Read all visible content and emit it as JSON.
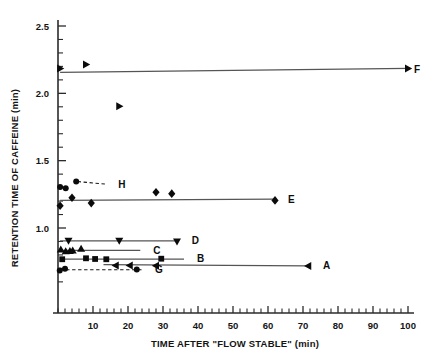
{
  "chart_data": {
    "type": "scatter",
    "title": "",
    "xlabel": "TIME AFTER \"FLOW STABLE\" (min)",
    "ylabel": "RETENTION TIME OF CAFFEINE (min)",
    "xlim": [
      0,
      102
    ],
    "ylim": [
      0.58,
      2.5
    ],
    "grid": false,
    "legend_position": "inline-right-of-series",
    "x_ticks_major": [
      10,
      20,
      30,
      40,
      50,
      60,
      70,
      80,
      90,
      100
    ],
    "x_ticklabels": [
      "10",
      "20",
      "30",
      "40",
      "50",
      "60",
      "70",
      "80",
      "90",
      "100"
    ],
    "x_tick_minor_step": 2,
    "y_ticks_major": [
      1.0,
      1.5,
      2.0,
      2.5
    ],
    "y_ticklabels": [
      "1.0",
      "1.5",
      "2.0",
      "2.5"
    ],
    "y_tick_minor_step": 0.1,
    "series": [
      {
        "name": "F",
        "label": "F",
        "marker": "triangle-right",
        "line": "solid",
        "label_x": 100,
        "label_y": 2.18,
        "trend": [
          [
            0.6,
            2.155
          ],
          [
            100,
            2.185
          ]
        ],
        "points": [
          [
            0.6,
            2.185
          ],
          [
            8.0,
            2.215
          ],
          [
            17.5,
            1.905
          ],
          [
            100.0,
            2.185
          ]
        ]
      },
      {
        "name": "E",
        "label": "E",
        "marker": "diamond",
        "line": "solid",
        "label_x": 64,
        "label_y": 1.215,
        "trend": [
          [
            0.6,
            1.205
          ],
          [
            62.0,
            1.215
          ]
        ],
        "points": [
          [
            0.6,
            1.165
          ],
          [
            4.0,
            1.225
          ],
          [
            9.5,
            1.185
          ],
          [
            28.0,
            1.265
          ],
          [
            32.5,
            1.255
          ],
          [
            62.0,
            1.205
          ]
        ]
      },
      {
        "name": "H",
        "label": "H",
        "marker": "circle",
        "line": "dashed-leader",
        "label_x": 15.5,
        "label_y": 1.325,
        "leader": [
          [
            5.6,
            1.345
          ],
          [
            14.0,
            1.325
          ]
        ],
        "points": [
          [
            0.6,
            1.305
          ],
          [
            2.2,
            1.295
          ],
          [
            5.2,
            1.345
          ]
        ]
      },
      {
        "name": "D",
        "label": "D",
        "marker": "triangle-down",
        "line": "solid",
        "label_x": 36.5,
        "label_y": 0.905,
        "trend": [
          [
            0.6,
            0.905
          ],
          [
            34.5,
            0.905
          ]
        ],
        "points": [
          [
            3.0,
            0.905
          ],
          [
            17.5,
            0.905
          ],
          [
            34.0,
            0.9
          ]
        ]
      },
      {
        "name": "C",
        "label": "C",
        "marker": "triangle-up",
        "line": "solid",
        "label_x": 25.5,
        "label_y": 0.835,
        "trend": [
          [
            0.6,
            0.833
          ],
          [
            23.5,
            0.833
          ]
        ],
        "points": [
          [
            0.8,
            0.84
          ],
          [
            2.2,
            0.828
          ],
          [
            3.4,
            0.83
          ],
          [
            4.2,
            0.832
          ],
          [
            6.6,
            0.845
          ]
        ]
      },
      {
        "name": "B",
        "label": "B",
        "marker": "square",
        "line": "solid",
        "label_x": 38,
        "label_y": 0.77,
        "trend": [
          [
            0.6,
            0.768
          ],
          [
            36.0,
            0.768
          ]
        ],
        "points": [
          [
            1.2,
            0.768
          ],
          [
            8.0,
            0.775
          ],
          [
            10.6,
            0.77
          ],
          [
            13.8,
            0.768
          ],
          [
            29.5,
            0.772
          ]
        ]
      },
      {
        "name": "A",
        "label": "A",
        "marker": "triangle-left",
        "line": "solid",
        "label_x": 74,
        "label_y": 0.718,
        "trend": [
          [
            13.0,
            0.728
          ],
          [
            71.5,
            0.718
          ]
        ],
        "points": [
          [
            16.5,
            0.722
          ],
          [
            20.5,
            0.722
          ],
          [
            28.0,
            0.72
          ],
          [
            71.5,
            0.718
          ]
        ]
      },
      {
        "name": "G",
        "label": "G",
        "marker": "circle",
        "line": "dashed-leader",
        "label_x": 26,
        "label_y": 0.69,
        "leader": [
          [
            0.6,
            0.69
          ],
          [
            24.5,
            0.69
          ]
        ],
        "points": [
          [
            0.5,
            0.684
          ],
          [
            2.0,
            0.698
          ],
          [
            22.5,
            0.692
          ]
        ]
      }
    ]
  }
}
